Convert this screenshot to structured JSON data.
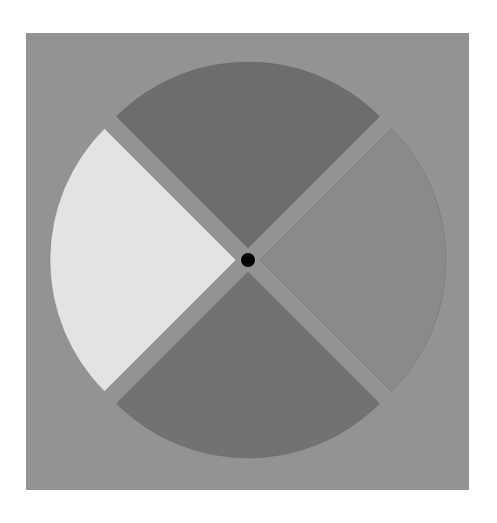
{
  "figure": {
    "background_square": {
      "x": 26,
      "y": 33,
      "width": 443,
      "height": 457,
      "color": "#939393"
    },
    "center": {
      "x": 248,
      "y": 260
    },
    "radius": 186,
    "explode_offset": 12,
    "center_dot": {
      "radius": 7,
      "color": "#000000"
    },
    "wedges": [
      {
        "name": "top",
        "start_deg": 225,
        "end_deg": 315,
        "color": "#6d6d6d"
      },
      {
        "name": "right",
        "start_deg": -45,
        "end_deg": 45,
        "color": "#8a8a8a"
      },
      {
        "name": "bottom",
        "start_deg": 45,
        "end_deg": 135,
        "color": "#727272"
      },
      {
        "name": "left",
        "start_deg": 135,
        "end_deg": 225,
        "color": "#e3e3e3"
      }
    ]
  }
}
